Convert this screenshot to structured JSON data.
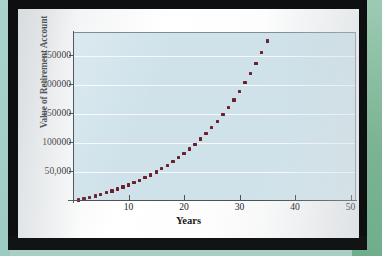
{
  "chart_data": {
    "type": "scatter",
    "title": "",
    "xlabel": "Years",
    "ylabel": "Value of Retirement Account",
    "xlim": [
      0,
      51
    ],
    "ylim": [
      0,
      290000
    ],
    "xticks": [
      10,
      20,
      30,
      40,
      50
    ],
    "xtick_labels": [
      "10",
      "20",
      "30",
      "40",
      "50"
    ],
    "yticks": [
      50000,
      100000,
      150000,
      200000,
      250000
    ],
    "ytick_labels": [
      "50,000",
      "100000",
      "150000",
      "200000",
      "250000"
    ],
    "grid": true,
    "grid_axis": "y",
    "legend": "none",
    "marker": "square",
    "marker_color": "#6e1f2e",
    "plot_background": "#cfe2ea",
    "series": [
      {
        "name": "Value of Retirement Account",
        "x": [
          1,
          2,
          3,
          4,
          5,
          6,
          7,
          8,
          9,
          10,
          11,
          12,
          13,
          14,
          15,
          16,
          17,
          18,
          19,
          20,
          21,
          22,
          23,
          24,
          25,
          26,
          27,
          28,
          29,
          30,
          31,
          32,
          33,
          34,
          35,
          36,
          37,
          38,
          39,
          40,
          41,
          42,
          43,
          44,
          45,
          46,
          47,
          48,
          49,
          50
        ],
        "y": [
          2000,
          4140,
          6430,
          8880,
          11501,
          14306,
          17308,
          20519,
          23956,
          27633,
          31567,
          35777,
          40281,
          45101,
          50258,
          55776,
          61680,
          67998,
          74758,
          81991,
          89730,
          98012,
          106873,
          116354,
          126499,
          137354,
          148969,
          161396,
          174694,
          188922,
          204147,
          220438,
          237869,
          256520,
          276477,
          297830,
          320678,
          345126,
          371285,
          399275,
          429225,
          461270,
          495559,
          532248,
          571506,
          613511,
          658457,
          706549,
          758007,
          813068
        ]
      }
    ]
  },
  "axis": {
    "y_title": "Value of Retirement Account",
    "x_title": "Years"
  }
}
